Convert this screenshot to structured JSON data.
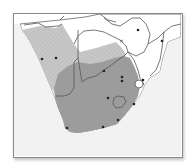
{
  "map": {
    "region": "Southern Africa",
    "colors": {
      "background": "#ffffff",
      "ocean": "#e8e8e8",
      "range_light": "#c4c4c4",
      "range_dark": "#9a9a9a",
      "border": "#666666",
      "point": "#222222"
    },
    "ranges": [
      {
        "name": "range-light",
        "shade": "light"
      },
      {
        "name": "range-dark",
        "shade": "dark"
      }
    ],
    "points": [
      {
        "x": 42,
        "y": 59
      },
      {
        "x": 56,
        "y": 58
      },
      {
        "x": 104,
        "y": 71
      },
      {
        "x": 122,
        "y": 77
      },
      {
        "x": 122,
        "y": 81
      },
      {
        "x": 108,
        "y": 98
      },
      {
        "x": 134,
        "y": 104
      },
      {
        "x": 118,
        "y": 120
      },
      {
        "x": 103,
        "y": 127
      },
      {
        "x": 67,
        "y": 128
      },
      {
        "x": 138,
        "y": 30
      },
      {
        "x": 162,
        "y": 41
      },
      {
        "x": 143,
        "y": 80
      }
    ],
    "marker_x": {
      "x": 121,
      "y": 41
    }
  }
}
